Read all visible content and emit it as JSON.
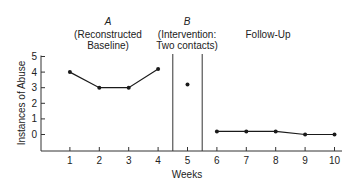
{
  "chart_data": {
    "type": "line",
    "title": "",
    "xlabel": "Weeks",
    "ylabel": "Instances of Abuse",
    "x": [
      1,
      2,
      3,
      4,
      5,
      6,
      7,
      8,
      9,
      10
    ],
    "xlim": [
      0,
      10.3
    ],
    "ylim": [
      -1,
      5
    ],
    "yticks": [
      0,
      1,
      2,
      3,
      4,
      5
    ],
    "xticks": [
      1,
      2,
      3,
      4,
      5,
      6,
      7,
      8,
      9,
      10
    ],
    "grid": false,
    "phases": [
      {
        "letter": "A",
        "line1": "(Reconstructed",
        "line2": "Baseline)",
        "weeks": [
          1,
          2,
          3,
          4
        ],
        "values": [
          4,
          3,
          3,
          4.2
        ]
      },
      {
        "letter": "B",
        "line1": "(Intervention:",
        "line2": "Two contacts)",
        "weeks": [
          5
        ],
        "values": [
          3.2
        ]
      },
      {
        "letter": "",
        "line1": "Follow-Up",
        "line2": "",
        "weeks": [
          6,
          7,
          8,
          9,
          10
        ],
        "values": [
          0.2,
          0.2,
          0.2,
          0,
          0
        ]
      }
    ],
    "phase_dividers": [
      4.5,
      5.5
    ],
    "series": [
      {
        "name": "Instances of Abuse",
        "values": [
          4,
          3,
          3,
          4.2,
          3.2,
          0.2,
          0.2,
          0.2,
          0,
          0
        ]
      }
    ],
    "colors": {
      "line": "#1a1a1a",
      "axis": "#333333"
    }
  }
}
